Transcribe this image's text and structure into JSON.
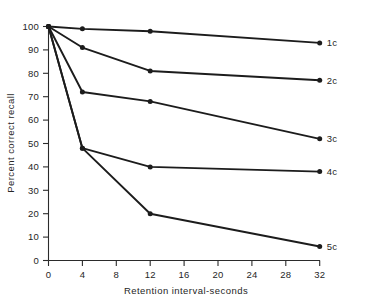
{
  "chart_data": {
    "type": "line",
    "title": "",
    "xlabel": "Retention interval-seconds",
    "ylabel": "Percent correct recall",
    "x": [
      0,
      4,
      12,
      32
    ],
    "xlim": [
      0,
      32
    ],
    "ylim": [
      0,
      100
    ],
    "xticks": [
      0,
      4,
      8,
      12,
      16,
      20,
      24,
      28,
      32
    ],
    "yticks": [
      0,
      10,
      20,
      30,
      40,
      50,
      60,
      70,
      80,
      90,
      100
    ],
    "xtick_labels": [
      "0",
      "4",
      "8",
      "12",
      "16",
      "20",
      "24",
      "28",
      "32"
    ],
    "ytick_labels": [
      "0",
      "10",
      "20",
      "30",
      "40",
      "50",
      "60",
      "70",
      "80",
      "90",
      "100"
    ],
    "grid": false,
    "legend_position": "right-inline-end-labels",
    "marker": "filled-circle",
    "line_color": "#1c1c1c",
    "series": [
      {
        "name": "1c",
        "values": [
          100,
          99,
          98,
          93
        ]
      },
      {
        "name": "2c",
        "values": [
          100,
          91,
          81,
          77
        ]
      },
      {
        "name": "3c",
        "values": [
          100,
          72,
          68,
          52
        ]
      },
      {
        "name": "4c",
        "values": [
          100,
          48,
          40,
          38
        ]
      },
      {
        "name": "5c",
        "values": [
          100,
          48,
          20,
          6
        ]
      }
    ]
  },
  "series_labels": {
    "s1": "1c",
    "s2": "2c",
    "s3": "3c",
    "s4": "4c",
    "s5": "5c"
  },
  "axes": {
    "x_title": "Retention interval-seconds",
    "y_title": "Percent correct recall",
    "x_tick_0": "0",
    "x_tick_1": "4",
    "x_tick_2": "8",
    "x_tick_3": "12",
    "x_tick_4": "16",
    "x_tick_5": "20",
    "x_tick_6": "24",
    "x_tick_7": "28",
    "x_tick_8": "32",
    "y_tick_0": "0",
    "y_tick_1": "10",
    "y_tick_2": "20",
    "y_tick_3": "30",
    "y_tick_4": "40",
    "y_tick_5": "50",
    "y_tick_6": "60",
    "y_tick_7": "70",
    "y_tick_8": "80",
    "y_tick_9": "90",
    "y_tick_10": "100"
  }
}
